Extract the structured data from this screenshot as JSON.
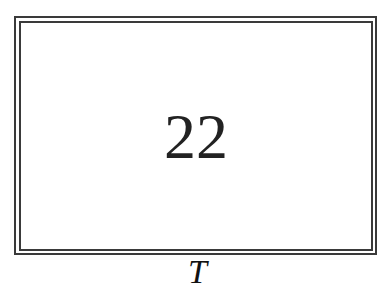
{
  "card": {
    "number": "22",
    "caption": "T"
  },
  "colors": {
    "frame": "#3a3a3a",
    "text": "#222222",
    "background": "#ffffff"
  }
}
